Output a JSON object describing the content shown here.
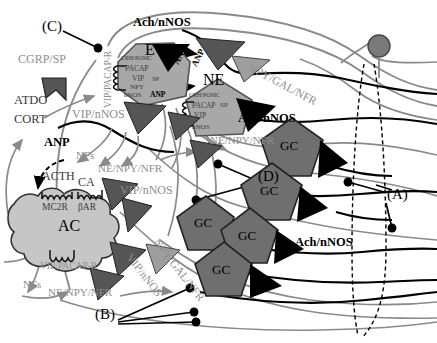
{
  "figure": {
    "type": "anatomical-schematic-diagram",
    "background": "#ffffff"
  },
  "colors": {
    "black": "#000000",
    "gray_label": "#8e8e8e",
    "gray_nerve": "#8a8a8a",
    "cell_chromaffin_fill": "#a8a8a8",
    "cell_gc_fill": "#6f6f6f",
    "cell_ac_fill": "#c6c6c6",
    "triangle_dark": "#555555",
    "triangle_mid": "#7a7a7a",
    "triangle_light": "#9e9e9e",
    "triangle_black": "#000000",
    "neuron_soma": "#7a7a7a",
    "dashed_outline": "#000000"
  },
  "callouts": [
    {
      "id": "A",
      "label": "(A)",
      "x": 387,
      "y": 195
    },
    {
      "id": "B",
      "label": "(B)",
      "x": 95,
      "y": 315
    },
    {
      "id": "C",
      "label": "(C)",
      "x": 42,
      "y": 27
    },
    {
      "id": "D",
      "label": "(D)",
      "x": 258,
      "y": 177
    }
  ],
  "cells": [
    {
      "name": "E",
      "kind": "chromaffin-epinephrine",
      "shape": "hexagon",
      "label": "E",
      "contents": [
        "CRH/POMC",
        "PACAP",
        "VIP",
        "SP",
        "NPY",
        "nNOS",
        "ANP"
      ],
      "x": 118,
      "y": 43,
      "w": 72,
      "h": 62
    },
    {
      "name": "NE",
      "kind": "chromaffin-norepinephrine",
      "shape": "pentagon",
      "label": "NE",
      "contents": [
        "CRH/POMC",
        "PACAP",
        "SP",
        "VIP",
        "nNOS"
      ],
      "x": 186,
      "y": 80,
      "w": 66,
      "h": 56
    },
    {
      "name": "AC",
      "kind": "adrenal-cortex-cell",
      "shape": "blob",
      "label": "AC",
      "contents": [
        "ACTH",
        "CA",
        "MC2R",
        "βAR",
        "VIP/PACAP-R"
      ],
      "x": 14,
      "y": 188,
      "w": 110,
      "h": 80
    }
  ],
  "ganglion_cells": [
    {
      "label": "GC",
      "x": 292,
      "y": 141,
      "size": 62
    },
    {
      "label": "GC",
      "x": 272,
      "y": 186,
      "size": 60
    },
    {
      "label": "GC",
      "x": 205,
      "y": 218,
      "size": 60
    },
    {
      "label": "GC",
      "x": 249,
      "y": 231,
      "size": 58
    },
    {
      "label": "GC",
      "x": 223,
      "y": 265,
      "size": 58
    }
  ],
  "neurotransmitter_labels": [
    {
      "text": "Ach/nNOS",
      "x": 133,
      "y": 24,
      "style": "black-bold",
      "rot": 0
    },
    {
      "text": "Ach/nNOS",
      "x": 238,
      "y": 119,
      "style": "black-bold",
      "rot": 0
    },
    {
      "text": "Ach/nNOS",
      "x": 295,
      "y": 243,
      "style": "black-bold",
      "rot": 0
    },
    {
      "text": "CGRP/SP",
      "x": 18,
      "y": 60,
      "style": "gray",
      "rot": 0
    },
    {
      "text": "VIP/nNOS",
      "x": 72,
      "y": 115,
      "style": "gray",
      "rot": 0
    },
    {
      "text": "VIP/nNOS",
      "x": 120,
      "y": 191,
      "style": "gray",
      "rot": 0
    },
    {
      "text": "VIP/PACAP-R",
      "x": 104,
      "y": 108,
      "style": "gray",
      "rot": -90
    },
    {
      "text": "VIP/PACAP-R",
      "x": 40,
      "y": 268,
      "style": "gray",
      "rot": 0
    },
    {
      "text": "NE/NPY/NFR",
      "x": 98,
      "y": 170,
      "style": "gray",
      "rot": 0
    },
    {
      "text": "NE/NPY/NFR",
      "x": 210,
      "y": 142,
      "style": "gray",
      "rot": 0
    },
    {
      "text": "NE/NPY/NFR",
      "x": 48,
      "y": 293,
      "style": "gray",
      "rot": 0
    },
    {
      "text": "NPY/GAL/NFR",
      "x": 252,
      "y": 70,
      "style": "gray",
      "rot": 28
    },
    {
      "text": "NPY/GAL/NFR",
      "x": 160,
      "y": 243,
      "style": "gray",
      "rot": 52
    },
    {
      "text": "VIP/nNOS",
      "x": 133,
      "y": 258,
      "style": "gray",
      "rot": 52
    },
    {
      "text": "ATDO",
      "x": 14,
      "y": 101,
      "style": "dark",
      "rot": 0
    },
    {
      "text": "CORT",
      "x": 14,
      "y": 120,
      "style": "dark",
      "rot": 0
    },
    {
      "text": "ANP",
      "x": 44,
      "y": 143,
      "style": "dark",
      "rot": 0
    },
    {
      "text": "ANP",
      "x": 175,
      "y": 63,
      "style": "dark-small",
      "rot": -60
    },
    {
      "text": "ANP",
      "x": 192,
      "y": 63,
      "style": "dark-small",
      "rot": -60
    },
    {
      "text": "NFs",
      "x": 76,
      "y": 157,
      "style": "gray",
      "rot": 0
    },
    {
      "text": "NFs",
      "x": 23,
      "y": 285,
      "style": "gray",
      "rot": 0
    },
    {
      "text": "ACTH",
      "x": 42,
      "y": 178,
      "style": "dark",
      "rot": 0
    },
    {
      "text": "CA",
      "x": 78,
      "y": 184,
      "style": "dark",
      "rot": 0
    },
    {
      "text": "MC2R",
      "x": 42,
      "y": 209,
      "style": "dark-small",
      "rot": 0
    },
    {
      "text": "βAR",
      "x": 78,
      "y": 209,
      "style": "dark-small",
      "rot": 0
    }
  ],
  "cell_inner_text": {
    "E": [
      {
        "t": "CRH/POMC",
        "x": 121,
        "y": 59
      },
      {
        "t": "PACAP",
        "x": 125,
        "y": 70
      },
      {
        "t": "VIP",
        "x": 132,
        "y": 80
      },
      {
        "t": "SP",
        "x": 152,
        "y": 81
      },
      {
        "t": "NPY",
        "x": 130,
        "y": 89
      },
      {
        "t": "nNOS",
        "x": 124,
        "y": 97
      },
      {
        "t": "ANP",
        "x": 152,
        "y": 96
      }
    ],
    "NE": [
      {
        "t": "CRH/POMC",
        "x": 189,
        "y": 96
      },
      {
        "t": "PACAP",
        "x": 192,
        "y": 107
      },
      {
        "t": "SP",
        "x": 219,
        "y": 107
      },
      {
        "t": "VIP",
        "x": 194,
        "y": 117
      },
      {
        "t": "nNOS",
        "x": 192,
        "y": 129
      }
    ]
  },
  "receptors": [
    {
      "name": "mc2r-coil",
      "x": 48,
      "y": 192,
      "turns": 5
    },
    {
      "name": "bar-coil",
      "x": 84,
      "y": 192,
      "turns": 5
    },
    {
      "name": "vip-pacap-r-coil",
      "x": 52,
      "y": 258,
      "turns": 5
    },
    {
      "name": "e-cell-receptor-coil",
      "x": 113,
      "y": 66,
      "turns": 5
    },
    {
      "name": "ne-cell-receptor-coil",
      "x": 182,
      "y": 100,
      "turns": 5
    }
  ],
  "neuron": {
    "name": "preganglionic-soma",
    "cx": 379,
    "cy": 46,
    "r": 11
  },
  "dashed_region": {
    "name": "splanchnic-nerve-outline",
    "present": true
  }
}
